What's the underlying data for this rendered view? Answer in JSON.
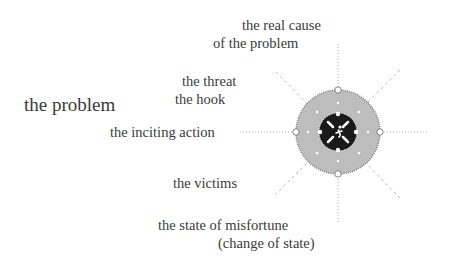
{
  "title": "the problem",
  "labels": {
    "real_cause_1": "the real cause",
    "real_cause_2": "of the problem",
    "threat": "the threat",
    "hook": "the hook",
    "inciting_action": "the inciting action",
    "victims": "the victims",
    "misfortune": "the state of misfortune",
    "change_of_state": "(change of state)"
  },
  "diagram": {
    "center": [
      338,
      132
    ],
    "outer_radius": 42,
    "inner_radius": 18,
    "outer_fill": "#bdbdbd",
    "inner_fill": "#1a1a1a",
    "center_icon": "running-figure-icon"
  }
}
